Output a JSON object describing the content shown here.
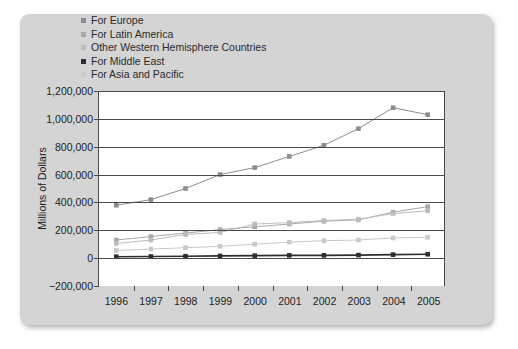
{
  "chart_data": {
    "type": "line",
    "title": "",
    "xlabel": "",
    "ylabel": "Millions of Dollars",
    "categories": [
      "1996",
      "1997",
      "1998",
      "1999",
      "2000",
      "2001",
      "2002",
      "2003",
      "2004",
      "2005"
    ],
    "ylim": [
      -200000,
      1200000
    ],
    "ytick_labels": [
      "1,200,000",
      "1,000,000",
      "800,000",
      "600,000",
      "400,000",
      "200,000",
      "0",
      "−200,000"
    ],
    "ytick_values": [
      1200000,
      1000000,
      800000,
      600000,
      400000,
      200000,
      0,
      -200000
    ],
    "grid": true,
    "legend_position": "top-left",
    "series": [
      {
        "name": "For Europe",
        "color": "#8c8c8c",
        "values": [
          380000,
          420000,
          500000,
          600000,
          650000,
          730000,
          810000,
          930000,
          1080000,
          1030000
        ]
      },
      {
        "name": "For Latin America",
        "color": "#a8a8a8",
        "values": [
          130000,
          155000,
          180000,
          205000,
          225000,
          245000,
          265000,
          275000,
          330000,
          370000
        ]
      },
      {
        "name": "Other Western Hemisphere Countries",
        "color": "#bdbdbd",
        "values": [
          105000,
          130000,
          170000,
          185000,
          245000,
          255000,
          270000,
          280000,
          320000,
          340000
        ]
      },
      {
        "name": "For Middle East",
        "color": "#2e2e2e",
        "values": [
          10000,
          12000,
          14000,
          16000,
          18000,
          20000,
          20000,
          22000,
          25000,
          28000
        ]
      },
      {
        "name": "For Asia and Pacific",
        "color": "#c9c9c9",
        "values": [
          55000,
          65000,
          75000,
          85000,
          100000,
          115000,
          125000,
          130000,
          145000,
          150000
        ]
      }
    ]
  },
  "colors": {
    "card_background": "#d4d4d4",
    "plot_background": "#ffffff",
    "axis": "#4a4a4a",
    "text": "#1d1d1d"
  }
}
